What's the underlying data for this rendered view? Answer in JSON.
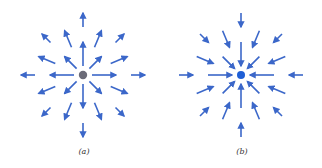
{
  "figure": {
    "panels": [
      {
        "id": "a",
        "caption": "(a)",
        "center": [
          83,
          75
        ],
        "charge_color": "#6b6b78",
        "field_direction": "outward",
        "arrow_color": "#3b67c9"
      },
      {
        "id": "b",
        "caption": "(b)",
        "center": [
          241,
          75
        ],
        "charge_color": "#1f5fd6",
        "field_direction": "inward",
        "arrow_color": "#3b67c9"
      }
    ]
  }
}
